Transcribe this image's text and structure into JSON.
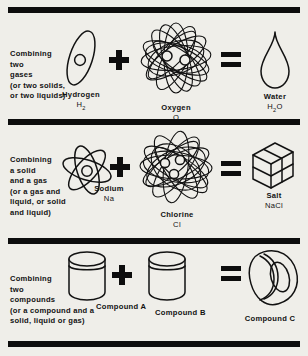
{
  "figure": {
    "background_color": "#efeee9",
    "ink_color": "#121212"
  },
  "operators": {
    "plus": "+",
    "equals": "="
  },
  "rows": [
    {
      "id": "gases",
      "description": "Combining\ntwo\ngases\n(or two solids,\nor two liquids)",
      "reactant_a": {
        "name": "Hydrogen",
        "formula": "H",
        "subscript": "2",
        "icon": "hydrogen-atom-icon"
      },
      "reactant_b": {
        "name": "Oxygen",
        "formula": "O",
        "subscript": "",
        "icon": "oxygen-atom-icon"
      },
      "product": {
        "name": "Water",
        "formula": "H",
        "subscript": "2",
        "formula_tail": "O",
        "icon": "water-droplet-icon"
      }
    },
    {
      "id": "solid-and-gas",
      "description": "Combining\na solid\nand a gas\n(or a gas and\nliquid, or solid\nand liquid)",
      "reactant_a": {
        "name": "Sodium",
        "formula": "Na",
        "subscript": "",
        "icon": "sodium-atom-icon"
      },
      "reactant_b": {
        "name": "Chlorine",
        "formula": "Cl",
        "subscript": "",
        "icon": "chlorine-atom-icon"
      },
      "product": {
        "name": "Salt",
        "formula": "NaCl",
        "subscript": "",
        "icon": "salt-cube-icon"
      }
    },
    {
      "id": "compounds",
      "description": "Combining\ntwo\ncompounds\n(or a compound and a\nsolid, liquid or gas)",
      "reactant_a": {
        "name": "Compound A",
        "formula": "",
        "subscript": "",
        "icon": "jar-icon"
      },
      "reactant_b": {
        "name": "Compound B",
        "formula": "",
        "subscript": "",
        "icon": "jar-icon"
      },
      "product": {
        "name": "Compound C",
        "formula": "",
        "subscript": "",
        "icon": "torus-icon"
      }
    }
  ]
}
